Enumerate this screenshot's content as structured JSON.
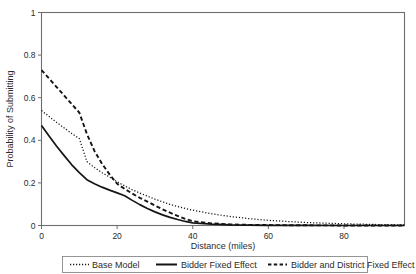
{
  "chart_data": {
    "type": "line",
    "title": "",
    "xlabel": "Distance (miles)",
    "ylabel": "Probability of Submitting",
    "xlim": [
      0,
      96
    ],
    "ylim": [
      0,
      1
    ],
    "grid": false,
    "legend_position": "bottom",
    "xticks": [
      0,
      20,
      40,
      60,
      80
    ],
    "xtick_labels": [
      "0",
      "20",
      "40",
      "60",
      "80"
    ],
    "yticks": [
      0,
      0.2,
      0.4,
      0.6,
      0.8,
      1
    ],
    "ytick_labels": [
      "0",
      "0.2",
      "0.4",
      "0.6",
      "0.8",
      "1"
    ],
    "x": [
      0,
      2,
      4,
      6,
      8,
      10,
      12,
      14,
      16,
      18,
      20,
      22,
      24,
      26,
      28,
      30,
      32,
      34,
      36,
      38,
      40,
      45,
      50,
      55,
      60,
      70,
      80,
      90,
      96
    ],
    "series": [
      {
        "name": "Base Model",
        "style": "dotted",
        "color": "#151515",
        "values": [
          0.54,
          0.512,
          0.484,
          0.458,
          0.432,
          0.408,
          0.3,
          0.272,
          0.248,
          0.228,
          0.205,
          0.186,
          0.168,
          0.152,
          0.138,
          0.124,
          0.111,
          0.099,
          0.089,
          0.08,
          0.072,
          0.055,
          0.042,
          0.032,
          0.024,
          0.014,
          0.008,
          0.004,
          0.003
        ]
      },
      {
        "name": "Bidder Fixed Effect",
        "style": "solid",
        "color": "#151515",
        "values": [
          0.47,
          0.42,
          0.372,
          0.328,
          0.285,
          0.248,
          0.215,
          0.196,
          0.18,
          0.166,
          0.153,
          0.14,
          0.118,
          0.098,
          0.08,
          0.064,
          0.05,
          0.038,
          0.028,
          0.019,
          0.012,
          0.006,
          0.003,
          0.002,
          0.001,
          0.001,
          0.0,
          0.0,
          0.0
        ]
      },
      {
        "name": "Bidder and District Fixed Effect",
        "style": "dashed",
        "color": "#151515",
        "values": [
          0.73,
          0.69,
          0.65,
          0.61,
          0.57,
          0.53,
          0.43,
          0.35,
          0.29,
          0.24,
          0.196,
          0.172,
          0.15,
          0.13,
          0.112,
          0.094,
          0.076,
          0.06,
          0.045,
          0.031,
          0.02,
          0.01,
          0.005,
          0.003,
          0.002,
          0.001,
          0.0,
          0.0,
          0.0
        ]
      }
    ]
  },
  "legend": {
    "entries": [
      {
        "label": "Base Model"
      },
      {
        "label": "Bidder Fixed Effect"
      },
      {
        "label": "Bidder and District Fixed Effect"
      }
    ]
  }
}
